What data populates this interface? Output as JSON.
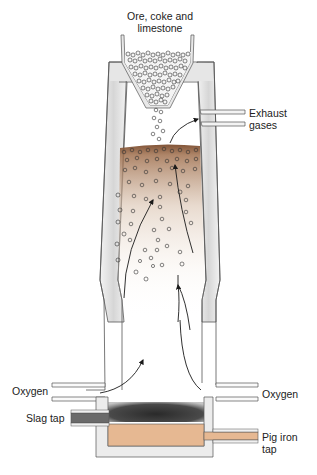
{
  "diagram": {
    "labels": {
      "input_line1": "Ore, coke and",
      "input_line2": "limestone",
      "exhaust_line1": "Exhaust",
      "exhaust_line2": "gases",
      "oxygen_left": "Oxygen",
      "oxygen_right": "Oxygen",
      "slag_tap": "Slag tap",
      "pig_iron_line1": "Pig iron",
      "pig_iron_line2": "tap"
    },
    "colors": {
      "wall_fill": "#e8e8e8",
      "wall_stroke": "#555555",
      "charge_band": "#8a5a3c",
      "slag": "#3a3a3a",
      "pig_iron": "#e6b892",
      "arrow": "#1a1a1a"
    }
  }
}
